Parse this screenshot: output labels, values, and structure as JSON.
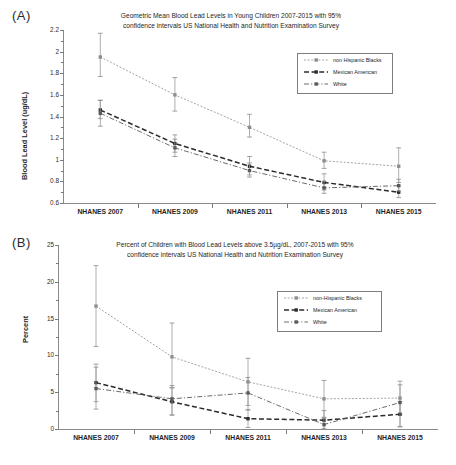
{
  "figure": {
    "panelA_letter": "(A)",
    "panelB_letter": "(B)"
  },
  "panelA": {
    "title_line1": "Geometric Mean Blood Lead Levels in Young Children 2007-2015 with 95%",
    "title_line2": "confidence intervals US National Health and Nutrition Examination Survey",
    "ylabel": "Blood Lead Level (ug/dL)",
    "ytick_labels": [
      "2.2",
      "2",
      "1.8",
      "1.6",
      "1.4",
      "1.2",
      "1",
      "0.8",
      "0.6"
    ],
    "xtick_labels": [
      "NHANES 2007",
      "NHANES 2009",
      "NHANES 2011",
      "NHANES 2013",
      "NHANES 2015"
    ],
    "legend": [
      {
        "label": "non Hispanic Blacks",
        "style": "dotted",
        "color": "#8d8d8d"
      },
      {
        "label": "Mexican American",
        "style": "dashed",
        "color": "#2b2b2b"
      },
      {
        "label": "White",
        "style": "dashdot",
        "color": "#5a5a5a"
      }
    ]
  },
  "panelB": {
    "title_line1": "Percent of Children with Blood Lead Levels above 3.5µg/dL, 2007-2015 with 95%",
    "title_line2": "confidence intervals US National Health and Nutrition Examination Survey",
    "ylabel": "Percent",
    "ytick_labels": [
      "25",
      "20",
      "15",
      "10",
      "5",
      "0"
    ],
    "xtick_labels": [
      "NHANES 2007",
      "NHANES 2009",
      "NHANES 2011",
      "NHANES 2013",
      "NHANES 2015"
    ],
    "legend": [
      {
        "label": "non-Hispanic Blacks",
        "style": "dotted",
        "color": "#8d8d8d"
      },
      {
        "label": "Mexican American",
        "style": "dashed",
        "color": "#2b2b2b"
      },
      {
        "label": "White",
        "style": "dashdot",
        "color": "#5a5a5a"
      }
    ]
  },
  "chart_data": [
    {
      "type": "line",
      "panel": "A",
      "title": "Geometric Mean Blood Lead Levels in Young Children 2007-2015 with 95% confidence intervals US National Health and Nutrition Examination Survey",
      "xlabel": "",
      "ylabel": "Blood Lead Level (ug/dL)",
      "categories": [
        "NHANES 2007",
        "NHANES 2009",
        "NHANES 2011",
        "NHANES 2013",
        "NHANES 2015"
      ],
      "ylim": [
        0.6,
        2.2
      ],
      "yticks": [
        0.6,
        0.8,
        1.0,
        1.2,
        1.4,
        1.6,
        1.8,
        2.0,
        2.2
      ],
      "grid": false,
      "legend_position": "top-right",
      "error_bars": "95% confidence intervals",
      "series": [
        {
          "name": "non Hispanic Blacks",
          "style": "dotted",
          "color": "#8d8d8d",
          "values": [
            1.95,
            1.6,
            1.3,
            0.99,
            0.94
          ],
          "ci_low": [
            1.77,
            1.45,
            1.21,
            0.92,
            0.79
          ],
          "ci_high": [
            2.17,
            1.76,
            1.42,
            1.07,
            1.11
          ]
        },
        {
          "name": "Mexican American",
          "style": "dashed",
          "color": "#2b2b2b",
          "values": [
            1.46,
            1.15,
            0.94,
            0.79,
            0.7
          ],
          "ci_low": [
            1.38,
            1.07,
            0.86,
            0.72,
            0.65
          ],
          "ci_high": [
            1.55,
            1.23,
            1.03,
            0.87,
            0.76
          ]
        },
        {
          "name": "White",
          "style": "dashdot",
          "color": "#5a5a5a",
          "values": [
            1.43,
            1.11,
            0.9,
            0.74,
            0.76
          ],
          "ci_low": [
            1.31,
            1.03,
            0.84,
            0.69,
            0.71
          ],
          "ci_high": [
            1.55,
            1.19,
            0.97,
            0.8,
            0.82
          ]
        }
      ]
    },
    {
      "type": "line",
      "panel": "B",
      "title": "Percent of Children with Blood Lead Levels above 3.5µg/dL, 2007-2015 with 95% confidence intervals US National Health and Nutrition Examination Survey",
      "xlabel": "",
      "ylabel": "Percent",
      "categories": [
        "NHANES 2007",
        "NHANES 2009",
        "NHANES 2011",
        "NHANES 2013",
        "NHANES 2015"
      ],
      "ylim": [
        0,
        25
      ],
      "yticks": [
        0,
        5,
        10,
        15,
        20,
        25
      ],
      "grid": false,
      "legend_position": "right",
      "error_bars": "95% confidence intervals",
      "series": [
        {
          "name": "non-Hispanic Blacks",
          "style": "dotted",
          "color": "#8d8d8d",
          "values": [
            16.7,
            9.8,
            6.4,
            4.1,
            4.2
          ],
          "ci_low": [
            11.2,
            5.6,
            3.2,
            1.6,
            2.0
          ],
          "ci_high": [
            22.2,
            14.4,
            9.6,
            6.6,
            6.5
          ]
        },
        {
          "name": "Mexican American",
          "style": "dashed",
          "color": "#2b2b2b",
          "values": [
            6.3,
            3.7,
            1.4,
            1.2,
            2.0
          ],
          "ci_low": [
            3.7,
            1.9,
            0.2,
            0.0,
            0.3
          ],
          "ci_high": [
            8.8,
            5.6,
            2.6,
            2.5,
            3.7
          ]
        },
        {
          "name": "White",
          "style": "dashdot",
          "color": "#5a5a5a",
          "values": [
            5.5,
            4.1,
            4.9,
            0.6,
            3.6
          ],
          "ci_low": [
            2.7,
            1.9,
            2.6,
            0.0,
            0.3
          ],
          "ci_high": [
            8.4,
            5.9,
            7.0,
            1.5,
            6.0
          ]
        }
      ]
    }
  ]
}
